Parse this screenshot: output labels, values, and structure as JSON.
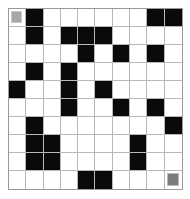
{
  "maze": {
    "rows": 10,
    "cols": 10,
    "legend": {
      "W": "open",
      "B": "wall",
      "S": "start",
      "E": "goal"
    },
    "colors": {
      "wall": "#0a0a0a",
      "open": "#ffffff",
      "start": "#a8a8a8",
      "goal": "#7c7c7c",
      "gridline": "#b8b8b8"
    },
    "grid": [
      [
        "S",
        "B",
        "W",
        "W",
        "W",
        "W",
        "W",
        "W",
        "B",
        "B"
      ],
      [
        "W",
        "B",
        "W",
        "B",
        "B",
        "B",
        "W",
        "W",
        "W",
        "W"
      ],
      [
        "W",
        "W",
        "W",
        "W",
        "B",
        "W",
        "B",
        "W",
        "B",
        "W"
      ],
      [
        "W",
        "B",
        "W",
        "B",
        "W",
        "W",
        "W",
        "W",
        "W",
        "W"
      ],
      [
        "B",
        "W",
        "W",
        "B",
        "W",
        "B",
        "W",
        "W",
        "W",
        "W"
      ],
      [
        "W",
        "W",
        "W",
        "B",
        "W",
        "W",
        "B",
        "W",
        "B",
        "W"
      ],
      [
        "W",
        "B",
        "W",
        "W",
        "W",
        "W",
        "W",
        "W",
        "W",
        "B"
      ],
      [
        "W",
        "B",
        "B",
        "W",
        "W",
        "W",
        "W",
        "B",
        "W",
        "W"
      ],
      [
        "W",
        "B",
        "B",
        "W",
        "W",
        "W",
        "W",
        "B",
        "W",
        "W"
      ],
      [
        "W",
        "W",
        "W",
        "W",
        "B",
        "B",
        "W",
        "W",
        "W",
        "E"
      ]
    ]
  }
}
